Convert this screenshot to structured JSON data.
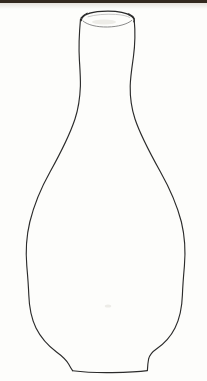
{
  "artwork": {
    "title": "Vase Contour Drawing",
    "subject": "vase",
    "technique": "pencil line drawing",
    "style": "single-line outline sketch",
    "canvas": {
      "width": 207,
      "height": 381
    },
    "background_color": "#fdfdfb",
    "ink_color": "#2b2b2b",
    "top_band_color": "#33291f"
  },
  "shapes": {
    "rim_label": "vase mouth opening",
    "neck_label": "vase neck",
    "shoulder_label": "vase shoulder",
    "body_label": "vase body",
    "foot_label": "vase foot",
    "base_label": "vase base"
  },
  "geometry": {
    "rim_ellipse": {
      "cx": 107,
      "cy": 19,
      "rx": 26,
      "ry": 6
    },
    "neck_top_left_x": 80,
    "neck_top_right_x": 134,
    "neck_waist_y": 86,
    "neck_waist_left_x": 80,
    "neck_waist_right_x": 128,
    "widest_y": 277,
    "widest_left_x": 27,
    "widest_right_x": 192,
    "base_y": 371,
    "base_left_x": 73,
    "base_right_x": 147,
    "foot_left_x": 66,
    "foot_right_x": 154,
    "foot_y": 352
  },
  "paths": {
    "left_contour": "M 80.5 19 C 79.2 33 78.6 47 79.4 60 C 80.0 70 80.6 78 80.4 86 C 80.0 97 78.6 108 75.0 119 C 69.0 137 60.0 154 50.0 172 C 41.0 188 34.0 205 29.8 222 C 26.2 237 25.6 252 26.8 266 C 27.6 275 28.4 285 28.8 295 C 29.2 307 31.2 318 36.0 328 C 41.0 338 48.5 346 56.5 352 C 62.0 356 66.2 360 68.6 364 C 70.2 367 71.4 369 72.6 370.6",
    "right_contour": "M 134.2 19.5 C 135.4 32 135.0 45 133.4 57 C 132.0 67 130.4 77 130.2 86 C 130.0 97 131.4 108 135.0 119 C 141.0 137 150.5 154 160.5 172 C 169.5 188 177.0 205 181.4 222 C 185.0 237 185.6 252 184.4 266 C 183.6 275 182.8 285 182.4 295 C 182.0 307 180.0 318 175.0 328 C 170.5 337 163.8 344 156.4 349 C 152.0 352 149.6 355 148.6 359 C 148.0 362 147.6 366 147.4 370.4",
    "base_line": "M 72.6 370.8 C 84 372.2 98 372.8 112 372.6 C 126 372.4 139 371.8 147.4 370.6",
    "rim_outer": "M 81.2 20.6 C 82.0 15.4 90.0 12.0 102.0 11.4 C 114.0 10.8 126.0 12.6 131.4 16.2 C 134.2 18.1 134.8 20.0 133.8 21.8",
    "rim_inner": "M 83.0 21.0 C 87.5 25.0 97.0 27.2 107.5 27.0 C 118.0 26.8 127.5 24.2 131.8 20.4",
    "rim_highlight": "M 88.0 16.8 C 95.0 14.6 106.0 13.8 115.5 14.4 C 122.0 14.8 127.0 15.9 129.6 17.4",
    "rim_tick_left": "M 81.0 18.2 C 82.4 16.0 84.6 14.4 87.2 13.2",
    "rim_tick_right": "M 128.6 13.8 C 131.2 15.0 133.2 16.6 134.2 18.6"
  },
  "marks": {
    "smudge_center": {
      "cx": 108,
      "cy": 306,
      "rx": 3.2,
      "ry": 1.6
    },
    "smudge_rim": {
      "cx": 104,
      "cy": 22,
      "rx": 12,
      "ry": 2.4
    }
  }
}
